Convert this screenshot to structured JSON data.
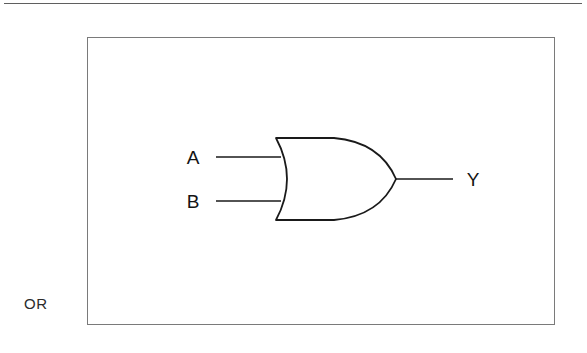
{
  "page": {
    "top_rule": "horizontal-rule"
  },
  "figure": {
    "gate_name": "OR",
    "gate_type": "or-gate",
    "inputs": [
      {
        "label": "A",
        "name": "input-a"
      },
      {
        "label": "B",
        "name": "input-b"
      }
    ],
    "output": {
      "label": "Y",
      "name": "output-y"
    },
    "colors": {
      "stroke": "#1a1a1a",
      "panel_border": "#7a7a7a",
      "rule": "#5f5f5f",
      "background": "#ffffff",
      "text": "#141414"
    }
  }
}
